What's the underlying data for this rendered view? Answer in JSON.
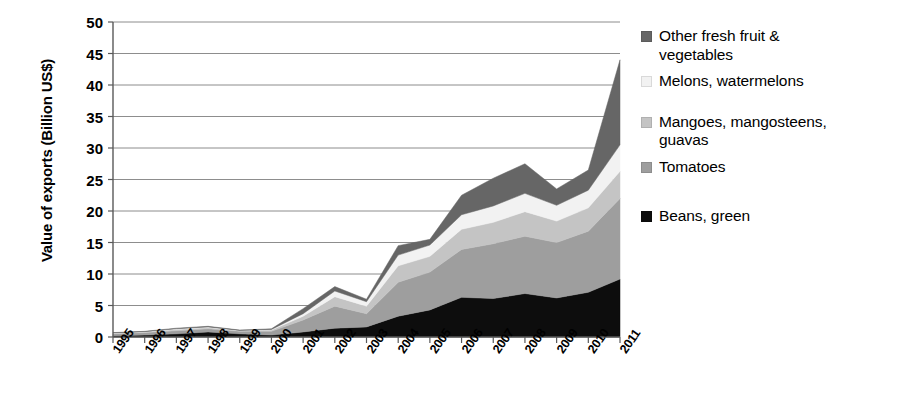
{
  "chart_data": {
    "type": "area",
    "stacked": true,
    "title": "",
    "subtitle": "",
    "xlabel": "",
    "ylabel": "Value of exports (Billion US$)",
    "grid": true,
    "legend_position": "right",
    "xlim": [
      1995,
      2011
    ],
    "ylim": [
      0,
      50
    ],
    "ytick_labels": [
      "50",
      "45",
      "40",
      "35",
      "30",
      "25",
      "20",
      "15",
      "10",
      "5",
      "0"
    ],
    "ytick_values": [
      50,
      45,
      40,
      35,
      30,
      25,
      20,
      15,
      10,
      5,
      0
    ],
    "categories": [
      "1995",
      "1996",
      "1997",
      "1998",
      "1999",
      "2000",
      "2001",
      "2002",
      "2003",
      "2004",
      "2005",
      "2006",
      "2007",
      "2008",
      "2009",
      "2010",
      "2011"
    ],
    "x": [
      1995,
      1996,
      1997,
      1998,
      1999,
      2000,
      2001,
      2002,
      2003,
      2004,
      2005,
      2006,
      2007,
      2008,
      2009,
      2010,
      2011
    ],
    "series": [
      {
        "name": "Beans, green",
        "color": "#0d0d0d",
        "stack_order": 1,
        "values": [
          0.2,
          0.3,
          0.5,
          0.8,
          0.5,
          0.3,
          0.8,
          1.4,
          1.6,
          3.3,
          4.3,
          6.3,
          6.1,
          6.9,
          6.2,
          7.1,
          9.2
        ]
      },
      {
        "name": "Tomatoes",
        "color": "#9e9e9e",
        "stack_order": 2,
        "values": [
          0.3,
          0.4,
          0.5,
          0.5,
          0.4,
          0.6,
          1.9,
          3.5,
          2.1,
          5.4,
          6.0,
          7.6,
          8.7,
          9.1,
          8.8,
          9.7,
          12.8
        ]
      },
      {
        "name": "Mangoes, mangosteens, guavas",
        "color": "#c4c4c4",
        "stack_order": 3,
        "values": [
          0.1,
          0.1,
          0.2,
          0.2,
          0.1,
          0.2,
          0.6,
          1.5,
          1.2,
          2.6,
          2.5,
          3.2,
          3.4,
          3.9,
          3.4,
          3.7,
          4.3
        ]
      },
      {
        "name": "Melons, watermelons",
        "color": "#f2f2f2",
        "stack_order": 4,
        "values": [
          0.05,
          0.05,
          0.1,
          0.1,
          0.05,
          0.1,
          0.4,
          0.9,
          0.7,
          1.7,
          1.8,
          2.3,
          2.6,
          2.9,
          2.5,
          2.8,
          4.2
        ]
      },
      {
        "name": "Other fresh fruit & vegetables",
        "color": "#666666",
        "stack_order": 5,
        "values": [
          0.05,
          0.05,
          0.1,
          0.1,
          0.05,
          0.1,
          0.8,
          0.7,
          0.4,
          1.5,
          0.9,
          3.1,
          4.4,
          4.7,
          2.6,
          3.2,
          13.5
        ]
      }
    ],
    "totals": [
      0.7,
      0.9,
      1.4,
      1.7,
      1.1,
      1.3,
      4.5,
      8.0,
      6.0,
      14.5,
      15.5,
      22.5,
      25.2,
      27.5,
      23.5,
      26.5,
      44.0
    ]
  },
  "legend": {
    "items": [
      {
        "label": "Other fresh fruit & vegetables",
        "color": "#666666"
      },
      {
        "label": "Melons, watermelons",
        "color": "#f2f2f2"
      },
      {
        "label": "Mangoes, mangosteens, guavas",
        "color": "#c4c4c4"
      },
      {
        "label": "Tomatoes",
        "color": "#9e9e9e"
      },
      {
        "label": "Beans, green",
        "color": "#0d0d0d"
      }
    ]
  },
  "axis": {
    "y_title": "Value of exports (Billion US$)"
  },
  "style": {
    "axis_color": "#595959",
    "grid_color": "#808080",
    "background": "#ffffff"
  }
}
